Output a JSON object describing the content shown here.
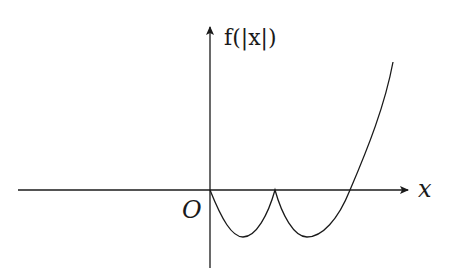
{
  "diagram": {
    "y_axis_label": "f(|x|)",
    "x_axis_label": "x",
    "origin_label": "O",
    "colors": {
      "stroke": "#1a1a1a",
      "background": "#ffffff"
    },
    "curve_description": "Graph of f(|x|) for x >= 0 region shown: starts at origin, dips to a minimum, returns to a cusp on the x-axis, dips to a second minimum, then rises crossing the x-axis and increasing steeply."
  }
}
